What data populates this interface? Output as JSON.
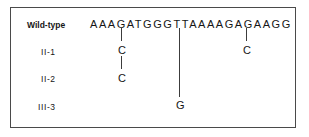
{
  "figure": {
    "kind": "dna-sequence-variant-diagram",
    "border_color": "#4a4a4a",
    "text_color": "#161616",
    "line_color": "#3c3c3c"
  },
  "rows": [
    {
      "label": "Wild-type",
      "bold": true,
      "sequence": "AAAGATGGGTTAAAAGAGAAGG",
      "mutations": []
    },
    {
      "label": "II-1",
      "bold": false,
      "sequence": "",
      "mutations": [
        {
          "base": "C",
          "position": 5
        },
        {
          "base": "C",
          "position": 18
        }
      ]
    },
    {
      "label": "II-2",
      "bold": false,
      "sequence": "",
      "mutations": [
        {
          "base": "C",
          "position": 5
        }
      ]
    },
    {
      "label": "III-3",
      "bold": false,
      "sequence": "",
      "mutations": [
        {
          "base": "G",
          "position": 11
        }
      ]
    }
  ],
  "connectors": [
    {
      "name": "tick-pos5-wildtype-to-II1",
      "position": 5,
      "from_row": 0,
      "to_row": 1
    },
    {
      "name": "tick-pos5-II1-to-II2",
      "position": 5,
      "from_row": 1,
      "to_row": 2
    },
    {
      "name": "tick-pos18-wildtype-to-II1",
      "position": 18,
      "from_row": 0,
      "to_row": 1
    },
    {
      "name": "tick-pos11-wildtype-to-III3",
      "position": 11,
      "from_row": 0,
      "to_row": 3
    }
  ]
}
